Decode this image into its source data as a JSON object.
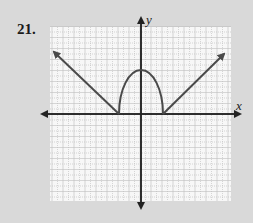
{
  "problem_number": "21.",
  "chart_data": {
    "type": "line",
    "title": "",
    "xlabel": "x",
    "ylabel": "y",
    "grid": true,
    "xlim": [
      -8,
      8
    ],
    "ylim": [
      -8,
      8
    ],
    "series": [
      {
        "name": "left ray",
        "points": [
          [
            -2,
            0
          ],
          [
            -8,
            6
          ]
        ],
        "arrow_end": true
      },
      {
        "name": "semi-ellipse arc",
        "points": [
          [
            -2,
            0
          ],
          [
            -1.5,
            2.6
          ],
          [
            -1,
            3.5
          ],
          [
            0,
            4
          ],
          [
            1,
            3.5
          ],
          [
            1.5,
            2.6
          ],
          [
            2,
            0
          ]
        ]
      },
      {
        "name": "right ray",
        "points": [
          [
            2,
            0
          ],
          [
            8,
            6
          ]
        ],
        "arrow_end": true
      }
    ],
    "annotations": [
      "x-intercepts at x = -2 and x = 2",
      "maximum at (0, 4)"
    ]
  },
  "colors": {
    "background": "#d9d9d9",
    "grid_bg": "#f7f7f7",
    "grid_line": "#bdbdbd",
    "curve": "#4a4a4a",
    "axis": "#222222"
  }
}
